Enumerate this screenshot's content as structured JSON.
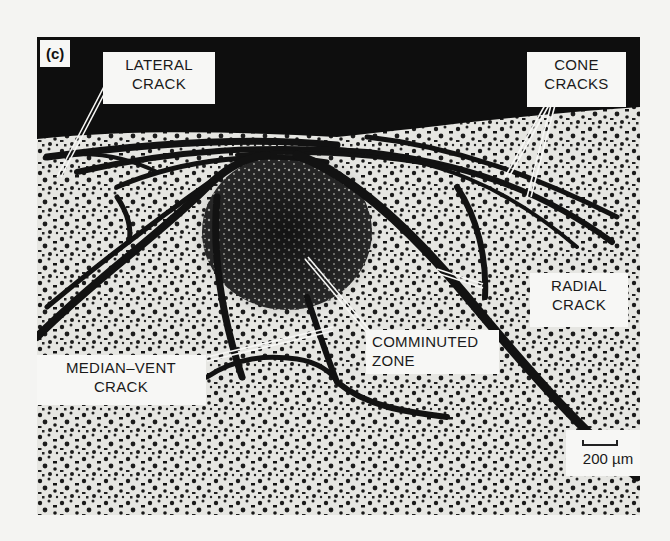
{
  "figure": {
    "panel_tag": "(c)",
    "labels": {
      "lateral_crack": [
        "LATERAL",
        "CRACK"
      ],
      "cone_cracks": [
        "CONE",
        "CRACKS"
      ],
      "radial_crack": [
        "RADIAL",
        "CRACK"
      ],
      "median_vent_crack": [
        "MEDIAN–VENT",
        "CRACK"
      ],
      "comminuted_zone": [
        "COMMINUTED",
        "ZONE"
      ]
    },
    "scale_bar": {
      "value": "200 µm"
    },
    "colors": {
      "background": "#f4f4f2",
      "dark_band": "#0e0e0e",
      "specimen": "#e6e6e2",
      "crack": "#121212",
      "label_fill": "#f7f7f5"
    }
  }
}
